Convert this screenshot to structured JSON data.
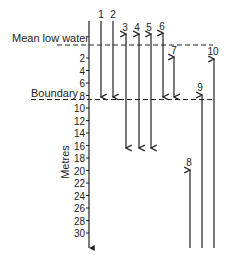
{
  "diagram": {
    "axis_label": "Metres",
    "reference_lines": [
      {
        "label": "Mean low water",
        "depth": 0
      },
      {
        "label": "Boundary",
        "depth": 8
      }
    ],
    "ticks": [
      "2",
      "4",
      "6",
      "8",
      "10",
      "12",
      "14",
      "16",
      "18",
      "20",
      "22",
      "24",
      "26",
      "28",
      "30"
    ],
    "arrows": [
      {
        "id": "1",
        "label": "1",
        "direction": "down",
        "from": "above surface",
        "to": "Boundary (8 m)"
      },
      {
        "id": "2",
        "label": "2",
        "direction": "down",
        "from": "above surface",
        "to": "Boundary (8 m)"
      },
      {
        "id": "3",
        "label": "3",
        "direction": "both",
        "from": "above surface",
        "to": "~16 m"
      },
      {
        "id": "4",
        "label": "4",
        "direction": "both",
        "from": "above surface",
        "to": "~16 m"
      },
      {
        "id": "5",
        "label": "5",
        "direction": "both",
        "from": "above surface",
        "to": "~16 m"
      },
      {
        "id": "6",
        "label": "6",
        "direction": "both",
        "from": "above surface",
        "to": "Boundary (8 m)"
      },
      {
        "id": "7",
        "label": "7",
        "direction": "both",
        "from": "~1 m",
        "to": "Boundary (8 m)"
      },
      {
        "id": "8",
        "label": "8",
        "direction": "up",
        "from": "below 30 m",
        "to": "~19 m"
      },
      {
        "id": "9",
        "label": "9",
        "direction": "up",
        "from": "below 30 m",
        "to": "Boundary (8 m)"
      },
      {
        "id": "10",
        "label": "10",
        "direction": "up",
        "from": "below 30 m",
        "to": "~1 m"
      }
    ]
  }
}
